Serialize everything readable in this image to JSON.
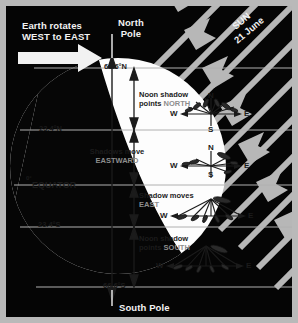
{
  "diagram": {
    "colors": {
      "frame": "#b9b9b9",
      "space": "#050505",
      "earth_lit": "#fdfdfd",
      "earth_dark": "#060606",
      "sun_ray": "#b7b7b7",
      "text_light": "#f2f2f2",
      "text_dark": "#1b1b1b",
      "text_gray": "#8d8d8d",
      "latitude_line": "#b0b0b0"
    }
  },
  "annotations": {
    "rotation_line1": "Earth rotates",
    "rotation_line2": "WEST to EAST",
    "north_pole_line1": "North",
    "north_pole_line2": "Pole",
    "south_pole": "South Pole",
    "sun_line1": "SUN",
    "sun_line2": "21 June"
  },
  "latitudes": [
    {
      "label": "66.6°N",
      "name": "arctic-circle"
    },
    {
      "label": "23.4°N",
      "name": "tropic-of-cancer"
    },
    {
      "label": "0°",
      "name": "equator-degrees"
    },
    {
      "label": "EQUATOR",
      "name": "equator-word"
    },
    {
      "label": "23.4°S",
      "name": "tropic-of-capricorn"
    },
    {
      "label": "66.6°S",
      "name": "antarctic-circle"
    }
  ],
  "zones": [
    {
      "name": "zone-arctic",
      "line1": "Noon shadow",
      "line2_plain": "points ",
      "line2_accent": "NORTH",
      "compass": {
        "w": "W",
        "e": "E",
        "n": "N",
        "s": "S"
      }
    },
    {
      "name": "zone-northern-tropic",
      "line1": "Shadows move",
      "line2_plain": "",
      "line2_accent": "EASTWARD",
      "compass": {
        "w": "W",
        "e": "E",
        "n": "N",
        "s": "S"
      }
    },
    {
      "name": "zone-equatorial",
      "line1": "Shadow moves",
      "line2_plain": "",
      "line2_accent": "EAST",
      "compass": {
        "w": "W",
        "e": "E",
        "n": "N",
        "s": "S"
      }
    },
    {
      "name": "zone-southern",
      "line1": "Noon shadow",
      "line2_plain": "points ",
      "line2_accent": "SOUTH",
      "compass": {
        "w": "W",
        "e": "E",
        "n": "N",
        "s": "S"
      }
    }
  ]
}
